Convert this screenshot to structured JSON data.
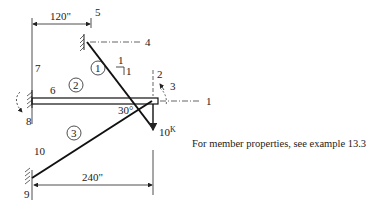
{
  "figure": {
    "dimensions": {
      "top": "120\"",
      "bottom": "240\""
    },
    "angle": "30°",
    "slope": {
      "rise": "1",
      "run": "1"
    },
    "load": {
      "value": "10",
      "unit": "K"
    },
    "members": [
      "1",
      "2",
      "3"
    ],
    "dof_labels": [
      "1",
      "2",
      "3",
      "4",
      "5",
      "6",
      "7",
      "8",
      "9",
      "10"
    ],
    "note": "For member properties, see example 13.3"
  }
}
